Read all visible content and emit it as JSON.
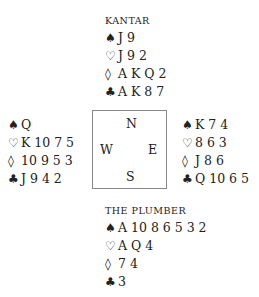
{
  "north": {
    "name": "KANTAR",
    "spades": "J 9",
    "hearts": "J 9 2",
    "diamonds": "A K Q 2",
    "clubs": "A K 8 7"
  },
  "west": {
    "spades": "Q",
    "hearts": "K 10 7 5",
    "diamonds": "10 9 5 3",
    "clubs": "J 9 4 2"
  },
  "east": {
    "spades": "K 7 4",
    "hearts": "8 6 3",
    "diamonds": "J 8 6",
    "clubs": "Q 10 6 5"
  },
  "south": {
    "name": "THE PLUMBER",
    "spades": "A 10 8 6 5 3 2",
    "hearts": "A Q 4",
    "diamonds": "7 4",
    "clubs": "3"
  },
  "compass": {
    "n": "N",
    "w": "W",
    "e": "E",
    "s": "S"
  },
  "icons": {
    "spade": "♠",
    "heart": "♡",
    "diamond": "◊",
    "club": "♣"
  }
}
